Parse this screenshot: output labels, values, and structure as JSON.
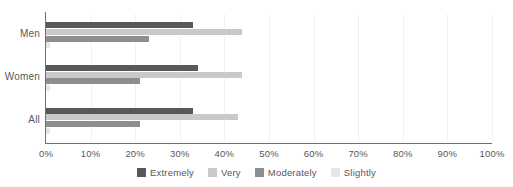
{
  "chart_data": {
    "type": "bar",
    "orientation": "horizontal",
    "title": "",
    "xlabel": "",
    "ylabel": "",
    "categories": [
      "Men",
      "Women",
      "All"
    ],
    "series": [
      {
        "name": "Extremely",
        "color": "#58585a",
        "values": [
          33,
          34,
          33
        ]
      },
      {
        "name": "Very",
        "color": "#c9c9c9",
        "values": [
          44,
          44,
          43
        ]
      },
      {
        "name": "Moderately",
        "color": "#8d8e90",
        "values": [
          23,
          21,
          21
        ]
      },
      {
        "name": "Slightly",
        "color": "#e6e6e6",
        "values": [
          1,
          1,
          1
        ]
      }
    ],
    "xlim": [
      0,
      100
    ],
    "xticks": [
      0,
      10,
      20,
      30,
      40,
      50,
      60,
      70,
      80,
      90,
      100
    ],
    "xtick_labels": [
      "0%",
      "10%",
      "20%",
      "30%",
      "40%",
      "50%",
      "60%",
      "70%",
      "80%",
      "90%",
      "100%"
    ],
    "grid": "vertical-light",
    "legend_position": "bottom-center"
  },
  "axis": {
    "ticks": [
      {
        "value": 0,
        "label": "0%"
      },
      {
        "value": 10,
        "label": "10%"
      },
      {
        "value": 20,
        "label": "20%"
      },
      {
        "value": 30,
        "label": "30%"
      },
      {
        "value": 40,
        "label": "40%"
      },
      {
        "value": 50,
        "label": "50%"
      },
      {
        "value": 60,
        "label": "60%"
      },
      {
        "value": 70,
        "label": "70%"
      },
      {
        "value": 80,
        "label": "80%"
      },
      {
        "value": 90,
        "label": "90%"
      },
      {
        "value": 100,
        "label": "100%"
      }
    ]
  },
  "groups": [
    {
      "label": "Men",
      "bars": [
        {
          "series": "Extremely",
          "value": 33
        },
        {
          "series": "Very",
          "value": 44
        },
        {
          "series": "Moderately",
          "value": 23
        },
        {
          "series": "Slightly",
          "value": 1
        }
      ]
    },
    {
      "label": "Women",
      "bars": [
        {
          "series": "Extremely",
          "value": 34
        },
        {
          "series": "Very",
          "value": 44
        },
        {
          "series": "Moderately",
          "value": 21
        },
        {
          "series": "Slightly",
          "value": 1
        }
      ]
    },
    {
      "label": "All",
      "bars": [
        {
          "series": "Extremely",
          "value": 33
        },
        {
          "series": "Very",
          "value": 43
        },
        {
          "series": "Moderately",
          "value": 21
        },
        {
          "series": "Slightly",
          "value": 1
        }
      ]
    }
  ],
  "legend": {
    "items": [
      {
        "label": "Extremely",
        "color": "#58585a"
      },
      {
        "label": "Very",
        "color": "#c9c9c9"
      },
      {
        "label": "Moderately",
        "color": "#8d8e90"
      },
      {
        "label": "Slightly",
        "color": "#e6e6e6"
      }
    ]
  }
}
